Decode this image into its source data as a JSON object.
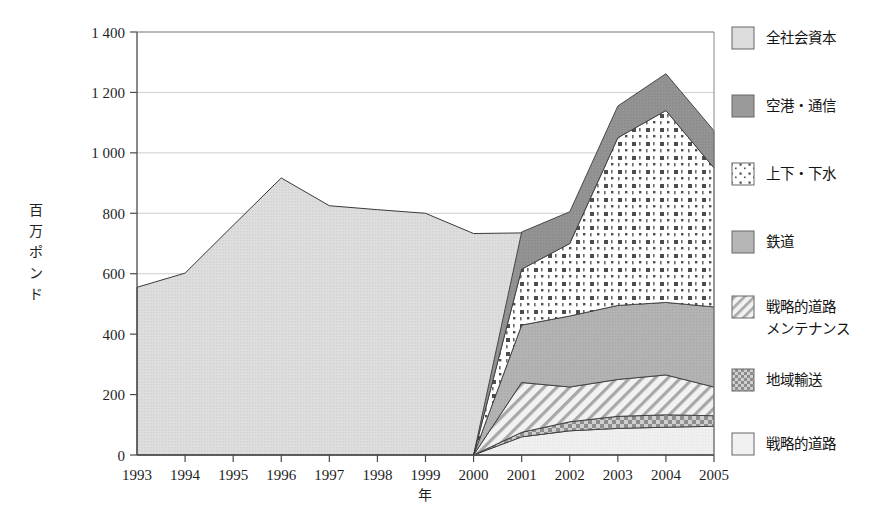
{
  "chart_data": {
    "type": "area",
    "stacked": true,
    "title": "",
    "subtitle": "",
    "xlabel": "年",
    "ylabel": "百万ポンド",
    "xlim": [
      1993,
      2005
    ],
    "ylim": [
      0,
      1400
    ],
    "ytick_step": 200,
    "grid": true,
    "grid_axis": "y",
    "legend_position": "right",
    "categories": [
      "1993",
      "1994",
      "1995",
      "1996",
      "1997",
      "1998",
      "1999",
      "2000",
      "2001",
      "2002",
      "2003",
      "2004",
      "2005"
    ],
    "x": [
      1993,
      1994,
      1995,
      1996,
      1997,
      1998,
      1999,
      2000,
      2001,
      2002,
      2003,
      2004,
      2005
    ],
    "yticks": [
      0,
      200,
      400,
      600,
      800,
      1000,
      1200,
      1400
    ],
    "ytick_labels": [
      "0",
      "200",
      "400",
      "600",
      "800",
      "1 000",
      "1 200",
      "1 400"
    ],
    "series": [
      {
        "name": "戦略的道路",
        "key": "strategic_roads",
        "pattern": "solid-verylight",
        "color": "#efefef",
        "values": [
          0,
          0,
          0,
          0,
          0,
          0,
          0,
          0,
          60,
          80,
          88,
          92,
          95
        ]
      },
      {
        "name": "地域輸送",
        "key": "regional_transport",
        "pattern": "checker",
        "color": "#bdbdbd",
        "values": [
          0,
          0,
          0,
          0,
          0,
          0,
          0,
          0,
          75,
          110,
          128,
          133,
          130
        ]
      },
      {
        "name": "戦略的道路メンテナンス",
        "key": "strategic_road_maintenance",
        "pattern": "diagonal-hatch",
        "color": "#e6e6e6",
        "values": [
          0,
          0,
          0,
          0,
          0,
          0,
          0,
          0,
          240,
          225,
          250,
          265,
          225
        ]
      },
      {
        "name": "鉄道",
        "key": "rail",
        "pattern": "solid-medium",
        "color": "#b0b0b0",
        "values": [
          0,
          0,
          0,
          0,
          0,
          0,
          0,
          0,
          430,
          460,
          495,
          505,
          490
        ]
      },
      {
        "name": "上下・下水",
        "key": "water_sewer",
        "pattern": "dotted",
        "color": "#ffffff",
        "values": [
          0,
          0,
          0,
          0,
          0,
          0,
          0,
          0,
          615,
          700,
          1050,
          1140,
          950
        ]
      },
      {
        "name": "空港・通信",
        "key": "airport_telecom",
        "pattern": "solid-dark",
        "color": "#8f8f8f",
        "values": [
          0,
          0,
          0,
          0,
          0,
          0,
          0,
          0,
          738,
          805,
          1155,
          1262,
          1073
        ]
      },
      {
        "name": "全社会資本",
        "key": "total_social_capital",
        "pattern": "solid-light",
        "color": "#d9d9d9",
        "values": [
          555,
          602,
          760,
          917,
          825,
          812,
          800,
          733,
          735,
          0,
          0,
          0,
          0
        ]
      }
    ],
    "notes": {
      "cumulative_from_2000": "Series 1-6 are cumulative stacked upper boundaries (million pounds) starting at 0 in year 2000.",
      "total_social_capital_range": "1993-2001"
    }
  },
  "axis": {
    "y_title": "百万ポンド",
    "x_title": "年"
  },
  "legend": {
    "items": [
      {
        "label": "全社会資本",
        "label_line2": "",
        "swatch": "solid-light"
      },
      {
        "label": "空港・通信",
        "label_line2": "",
        "swatch": "solid-dark"
      },
      {
        "label": "上下・下水",
        "label_line2": "",
        "swatch": "dotted"
      },
      {
        "label": "鉄道",
        "label_line2": "",
        "swatch": "solid-medium"
      },
      {
        "label": "戦略的道路",
        "label_line2": "メンテナンス",
        "swatch": "diagonal-hatch"
      },
      {
        "label": "地域輸送",
        "label_line2": "",
        "swatch": "checker"
      },
      {
        "label": "戦略的道路",
        "label_line2": "",
        "swatch": "solid-verylight"
      }
    ]
  },
  "colors": {
    "axis": "#4a4a4a",
    "grid": "#c9c9c9",
    "outline": "#3a3a3a",
    "text": "#1a1a1a"
  }
}
